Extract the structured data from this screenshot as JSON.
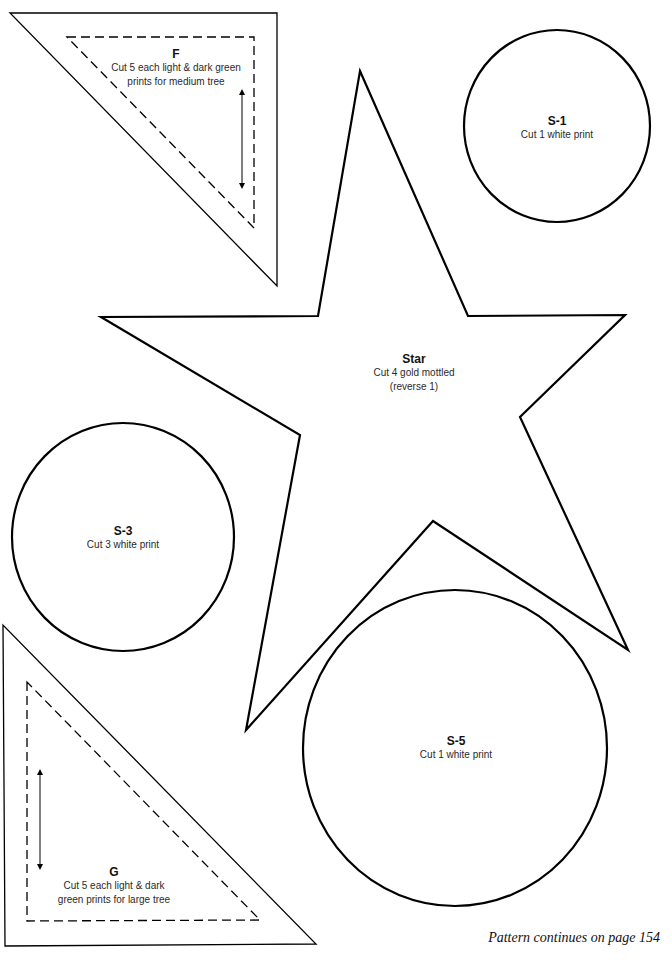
{
  "page": {
    "footer": "Pattern continues on page 154"
  },
  "pieces": {
    "F": {
      "title": "F",
      "lines": [
        "Cut 5 each light & dark green",
        "prints for medium tree"
      ]
    },
    "S1": {
      "title": "S-1",
      "lines": [
        "Cut 1 white print"
      ]
    },
    "Star": {
      "title": "Star",
      "lines": [
        "Cut 4 gold mottled",
        "(reverse 1)"
      ]
    },
    "S3": {
      "title": "S-3",
      "lines": [
        "Cut 3 white print"
      ]
    },
    "G": {
      "title": "G",
      "lines": [
        "Cut 5 each light & dark",
        "green prints for large tree"
      ]
    },
    "S5": {
      "title": "S-5",
      "lines": [
        "Cut 1 white print"
      ]
    }
  },
  "icons": {
    "grainline_arrow_F": "double-headed vertical arrow",
    "grainline_arrow_G": "double-headed vertical arrow"
  },
  "colors": {
    "stroke": "#000000",
    "text": "#2a2a2a",
    "background": "#ffffff"
  }
}
